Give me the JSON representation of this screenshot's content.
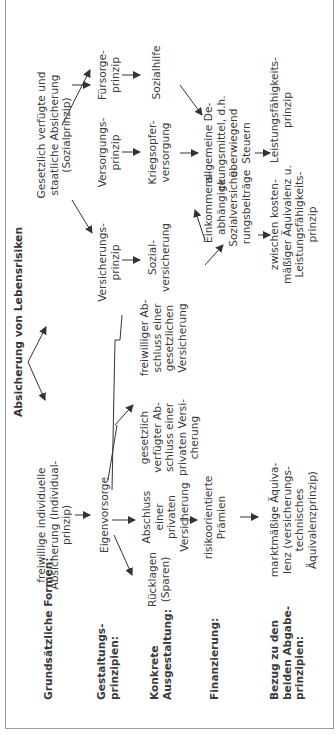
{
  "diagram": {
    "title": "Absicherung von Lebensrisiken",
    "row_labels": [
      "Grundsätzliche Formen:",
      "Gestaltungs-\nprinzipien:",
      "Konkrete\nAusgestaltung:",
      "Finanzierung:",
      "Bezug zu den\nbeiden Abgabe-\nprinzipien:"
    ],
    "nodes": {
      "individual": "freiwillige individuelle\nAbsicherung (Individual-\nprinzip)",
      "social": "Gesetzlich verfügte und\nstaatliche Absicherung\n(Sozialprinzip)",
      "eigenvorsorge": "Eigenvorsorge",
      "versicherungsprinzip": "Versicherungs-\nprinzip",
      "versorgungsprinzip": "Versorgungs-\nprinzip",
      "fuersorgeprinzip": "Fürsorge-\nprinzip",
      "ruecklagen": "Rücklagen\n(Sparen)",
      "abschluss_privat": "Abschluss\neiner privaten\nVersicherung",
      "gesetzlich_verfuegter": "gesetzlich\nverfügter Ab-\nschluss einer\nprivaten Versi-\ncherung",
      "freiwilliger_abschluss": "freiwilliger Ab-\nschluss einer\ngesetzlichen\nVersicherung",
      "sozialversicherung": "Sozial-\nversicherung",
      "kriegsopferversorgung": "Kriegsopfer-\nversorgung",
      "sozialhilfe": "Sozialhilfe",
      "risikoorientierte": "risikoorientierte\nPrämien",
      "einkommensabhaengige": "Einkommens-\nabhängige\nSozialversiche-\nrungsbeiträge",
      "deckungsmittel": "allgemeine De-\nckungsmittel, d.h.\nüberwiegend\nSteuern",
      "marktmaessige": "marktmäßige Äquiva-\nlenz (versicherungs-\ntechnisches\nÄquivalenzprinzip)",
      "zwischen": "zwischen kosten-\nmäßiger Äquivalenz u.\nLeistungsfähigkeits-\nprinzip",
      "leistungsfaehigkeit": "Leistungsfähigkeits-\nprinzip"
    }
  },
  "colors": {
    "text": "#3a3a3a",
    "border": "#9a9a9a",
    "arrow": "#333333",
    "background": "#ffffff"
  }
}
